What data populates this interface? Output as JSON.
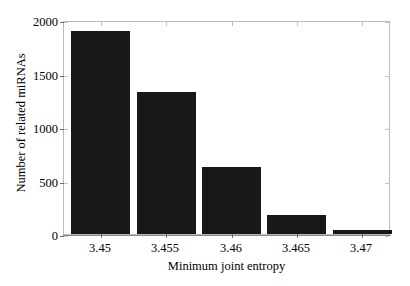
{
  "chart_data": {
    "type": "bar",
    "title": "",
    "xlabel": "Minimum joint entropy",
    "ylabel": "Number of related miRNAs",
    "categories": [
      "3.45",
      "3.455",
      "3.46",
      "3.465",
      "3.47"
    ],
    "values": [
      1900,
      1330,
      630,
      175,
      40
    ],
    "ylim": [
      0,
      2000
    ],
    "yticks": [
      0,
      500,
      1000,
      1500,
      2000
    ],
    "ytick_labels": [
      "0",
      "500",
      "1000",
      "1500",
      "2000"
    ],
    "xtick_labels": [
      "3.45",
      "3.455",
      "3.46",
      "3.465",
      "3.47"
    ],
    "grid": false,
    "legend": null,
    "bar_color": "#181818",
    "axes_color": "#8a8a8a",
    "background": "#ffffff",
    "series": [
      {
        "name": "Number of related miRNAs",
        "values": [
          1900,
          1330,
          630,
          175,
          40
        ]
      }
    ]
  }
}
